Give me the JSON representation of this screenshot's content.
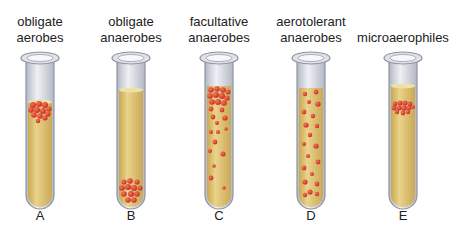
{
  "tubes": [
    {
      "letter": "A",
      "line1": "obligate",
      "line2": "aerobes",
      "cx": 40,
      "distribution": "top"
    },
    {
      "letter": "B",
      "line1": "obligate",
      "line2": "anaerobes",
      "cx": 131,
      "distribution": "bottom"
    },
    {
      "letter": "C",
      "line1": "facultative",
      "line2": "anaerobes",
      "cx": 219,
      "distribution": "top-dense-gradient"
    },
    {
      "letter": "D",
      "line1": "aerotolerant",
      "line2": "anaerobes",
      "cx": 311,
      "distribution": "even"
    },
    {
      "letter": "E",
      "line1": "microaerophiles",
      "line2": "",
      "cx": 403,
      "distribution": "near-top-band"
    }
  ],
  "colors": {
    "medium": "#e2c67a",
    "medium_dark": "#c9a850",
    "glass": "#b8bcc6",
    "colony": "#d9382a"
  }
}
